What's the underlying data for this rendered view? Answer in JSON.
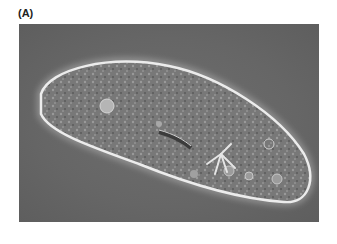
{
  "figure": {
    "panel_label": "(A)",
    "image_alt": "Phase-contrast micrograph of a Paramecium cell",
    "colors": {
      "background": "#666666",
      "cell_border": "#e8e8e8",
      "cell_interior": "#7a7a7a"
    }
  }
}
